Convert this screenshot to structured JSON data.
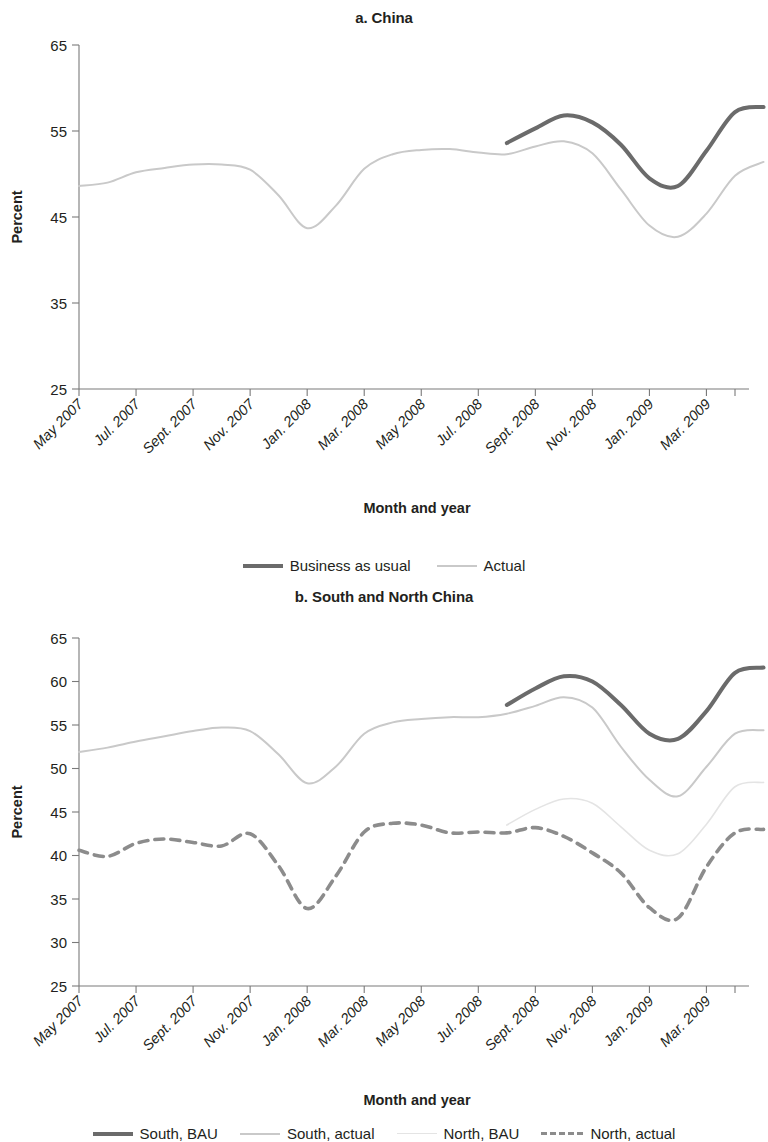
{
  "colors": {
    "bau_dark": "#6b6b6b",
    "actual_light": "#c9c9c9",
    "north_bau_faint": "#e4e4e4",
    "north_actual_dash": "#8c8c8c",
    "axis": "#7a7a7a",
    "text": "#231f20"
  },
  "panel_a": {
    "title": "a. China",
    "ylabel": "Percent",
    "xlabel": "Month and year",
    "legend": [
      {
        "label": "Business as usual",
        "style": "solid-thick",
        "color": "#6b6b6b"
      },
      {
        "label": "Actual",
        "style": "solid-thin",
        "color": "#c9c9c9"
      }
    ]
  },
  "panel_b": {
    "title": "b. South and North China",
    "ylabel": "Percent",
    "xlabel": "Month and year",
    "legend": [
      {
        "label": "South, BAU",
        "style": "solid-thick",
        "color": "#6b6b6b"
      },
      {
        "label": "South, actual",
        "style": "solid-thin",
        "color": "#c9c9c9"
      },
      {
        "label": "North, BAU",
        "style": "solid-faint",
        "color": "#e4e4e4"
      },
      {
        "label": "North, actual",
        "style": "dashed",
        "color": "#8c8c8c"
      }
    ]
  },
  "chart_data": [
    {
      "type": "line",
      "title": "a. China",
      "xlabel": "Month and year",
      "ylabel": "Percent",
      "ylim": [
        25,
        65
      ],
      "yticks": [
        25,
        35,
        45,
        55,
        65
      ],
      "grid": false,
      "legend_position": "below",
      "x": [
        "May 2007",
        "Jun. 2007",
        "Jul. 2007",
        "Aug. 2007",
        "Sept. 2007",
        "Oct. 2007",
        "Nov. 2007",
        "Dec. 2007",
        "Jan. 2008",
        "Feb. 2008",
        "Mar. 2008",
        "Apr. 2008",
        "May 2008",
        "Jun. 2008",
        "Jul. 2008",
        "Aug. 2008",
        "Sept. 2008",
        "Oct. 2008",
        "Nov. 2008",
        "Dec. 2008",
        "Jan. 2009",
        "Feb. 2009",
        "Mar. 2009",
        "Apr. 2009"
      ],
      "xtick_labels": [
        "May 2007",
        "Jul. 2007",
        "Sept. 2007",
        "Nov. 2007",
        "Jan. 2008",
        "Mar. 2008",
        "May 2008",
        "Jul. 2008",
        "Sept. 2008",
        "Nov. 2008",
        "Jan. 2009",
        "Mar. 2009"
      ],
      "xtick_indices": [
        0,
        2,
        4,
        6,
        8,
        10,
        12,
        14,
        16,
        18,
        20,
        22
      ],
      "series": [
        {
          "name": "Business as usual",
          "style": "solid-thick",
          "color": "#6b6b6b",
          "start_index": 15,
          "values": [
            null,
            null,
            null,
            null,
            null,
            null,
            null,
            null,
            null,
            null,
            null,
            null,
            null,
            null,
            null,
            53.6,
            55.3,
            56.8,
            56.0,
            53.4,
            49.5,
            48.6,
            52.7,
            57.2,
            57.8
          ]
        },
        {
          "name": "Actual",
          "style": "solid-thin",
          "color": "#c9c9c9",
          "start_index": 0,
          "values": [
            48.6,
            49.0,
            50.2,
            50.7,
            51.1,
            51.1,
            50.5,
            47.5,
            43.7,
            46.3,
            50.6,
            52.3,
            52.8,
            52.9,
            52.5,
            52.3,
            53.2,
            53.8,
            52.4,
            48.2,
            44.0,
            42.7,
            45.4,
            49.8,
            51.4
          ]
        }
      ]
    },
    {
      "type": "line",
      "title": "b. South and North China",
      "xlabel": "Month and year",
      "ylabel": "Percent",
      "ylim": [
        25,
        65
      ],
      "yticks": [
        25,
        30,
        35,
        40,
        45,
        50,
        55,
        60,
        65
      ],
      "grid": false,
      "legend_position": "below",
      "x": [
        "May 2007",
        "Jun. 2007",
        "Jul. 2007",
        "Aug. 2007",
        "Sept. 2007",
        "Oct. 2007",
        "Nov. 2007",
        "Dec. 2007",
        "Jan. 2008",
        "Feb. 2008",
        "Mar. 2008",
        "Apr. 2008",
        "May 2008",
        "Jun. 2008",
        "Jul. 2008",
        "Aug. 2008",
        "Sept. 2008",
        "Oct. 2008",
        "Nov. 2008",
        "Dec. 2008",
        "Jan. 2009",
        "Feb. 2009",
        "Mar. 2009",
        "Apr. 2009"
      ],
      "xtick_labels": [
        "May 2007",
        "Jul. 2007",
        "Sept. 2007",
        "Nov. 2007",
        "Jan. 2008",
        "Mar. 2008",
        "May 2008",
        "Jul. 2008",
        "Sept. 2008",
        "Nov. 2008",
        "Jan. 2009",
        "Mar. 2009"
      ],
      "xtick_indices": [
        0,
        2,
        4,
        6,
        8,
        10,
        12,
        14,
        16,
        18,
        20,
        22
      ],
      "series": [
        {
          "name": "South, BAU",
          "style": "solid-thick",
          "color": "#6b6b6b",
          "start_index": 15,
          "values": [
            null,
            null,
            null,
            null,
            null,
            null,
            null,
            null,
            null,
            null,
            null,
            null,
            null,
            null,
            null,
            57.3,
            59.2,
            60.6,
            60.0,
            57.3,
            54.0,
            53.4,
            56.6,
            61.0,
            61.6
          ]
        },
        {
          "name": "South, actual",
          "style": "solid-thin",
          "color": "#c9c9c9",
          "start_index": 0,
          "values": [
            51.9,
            52.4,
            53.1,
            53.7,
            54.3,
            54.7,
            54.3,
            51.6,
            48.3,
            50.2,
            54.0,
            55.3,
            55.7,
            55.9,
            55.9,
            56.3,
            57.2,
            58.2,
            57.0,
            52.5,
            48.7,
            46.8,
            50.2,
            54.0,
            54.4
          ]
        },
        {
          "name": "North, BAU",
          "style": "solid-faint",
          "color": "#e4e4e4",
          "start_index": 15,
          "values": [
            null,
            null,
            null,
            null,
            null,
            null,
            null,
            null,
            null,
            null,
            null,
            null,
            null,
            null,
            null,
            43.5,
            45.3,
            46.5,
            46.0,
            43.3,
            40.6,
            40.2,
            43.6,
            47.9,
            48.4
          ]
        },
        {
          "name": "North, actual",
          "style": "dashed",
          "color": "#8c8c8c",
          "start_index": 0,
          "values": [
            40.6,
            39.9,
            41.4,
            41.9,
            41.5,
            41.1,
            42.5,
            38.8,
            33.9,
            37.6,
            42.7,
            43.7,
            43.5,
            42.6,
            42.7,
            42.6,
            43.2,
            42.2,
            40.3,
            38.0,
            34.0,
            32.8,
            38.7,
            42.6,
            43.0
          ]
        }
      ]
    }
  ]
}
